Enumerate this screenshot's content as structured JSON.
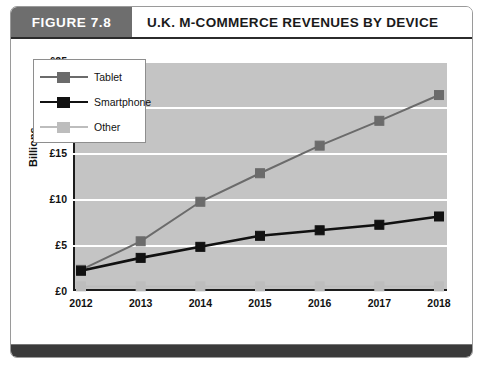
{
  "figure": {
    "tag": "FIGURE 7.8",
    "title": "U.K. M-COMMERCE REVENUES BY DEVICE"
  },
  "colors": {
    "plot_background": "#c4c4c4",
    "gridline": "#ffffff",
    "axis": "#1c1c1c",
    "tablet": "#6b6b6b",
    "smartphone": "#111111",
    "other": "#bdbdbd",
    "header_band": "#6e6e6e",
    "footer_bar": "#3a3a3a"
  },
  "chart_data": {
    "type": "line",
    "title": "U.K. M-COMMERCE REVENUES BY DEVICE",
    "xlabel": "",
    "ylabel": "Billions",
    "categories": [
      "2012",
      "2013",
      "2014",
      "2015",
      "2016",
      "2017",
      "2018"
    ],
    "ylim": [
      0,
      25
    ],
    "yticks": [
      0,
      5,
      10,
      15,
      20,
      25
    ],
    "ytick_labels": [
      "£0",
      "£5",
      "£10",
      "£15",
      "£20",
      "£25"
    ],
    "grid": true,
    "legend_position": "upper-left-inside",
    "series": [
      {
        "name": "Tablet",
        "values": [
          2.3,
          5.4,
          9.7,
          12.8,
          15.8,
          18.5,
          21.3
        ],
        "color": "#6b6b6b",
        "marker": "square"
      },
      {
        "name": "Smartphone",
        "values": [
          2.2,
          3.6,
          4.8,
          6.0,
          6.6,
          7.2,
          8.1
        ],
        "color": "#111111",
        "marker": "square"
      },
      {
        "name": "Other",
        "values": [
          0.5,
          0.5,
          0.5,
          0.5,
          0.5,
          0.5,
          0.5
        ],
        "color": "#bdbdbd",
        "marker": "square"
      }
    ]
  }
}
